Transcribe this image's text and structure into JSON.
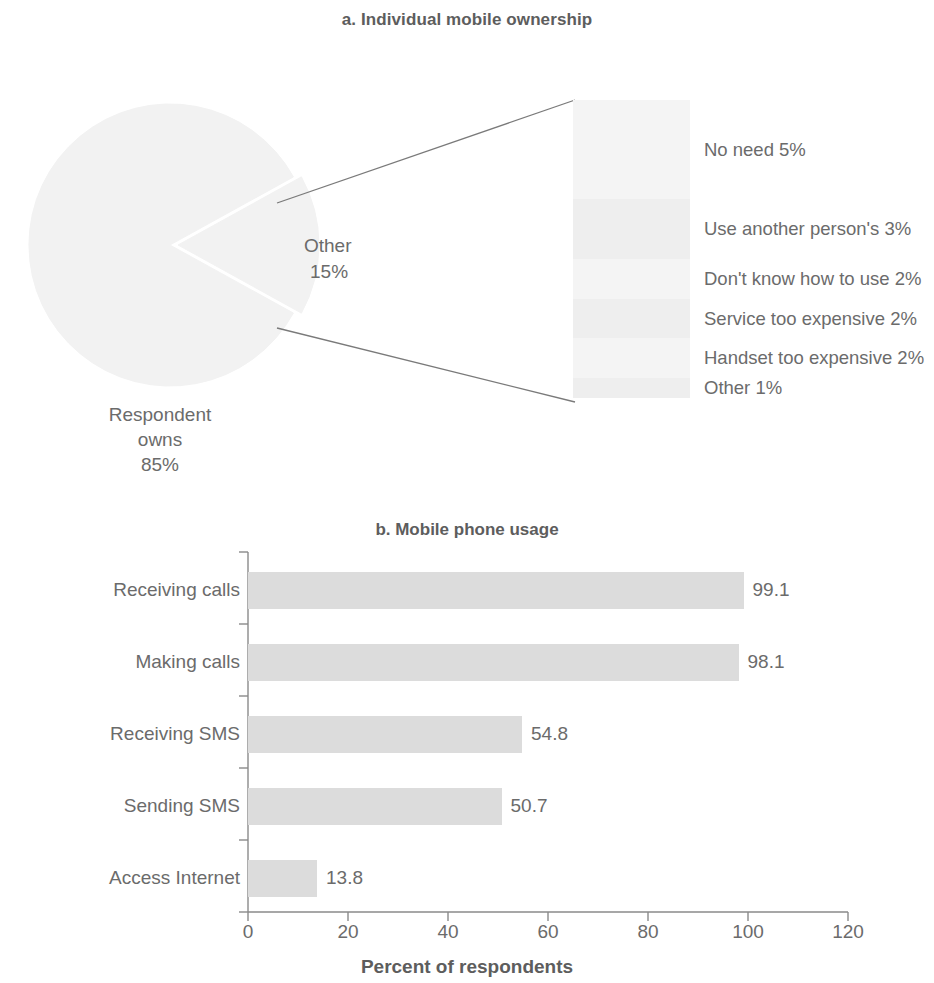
{
  "panel_a": {
    "title": "a. Individual mobile ownership",
    "owns_label": {
      "line1": "Respondent",
      "line2": "owns",
      "line3": "85%"
    },
    "other_label": {
      "line1": "Other",
      "line2": "15%"
    }
  },
  "panel_b": {
    "title": "b. Mobile phone usage"
  },
  "chart_data": [
    {
      "type": "pie",
      "title": "a. Individual mobile ownership",
      "categories": [
        "Respondent owns",
        "Other"
      ],
      "values": [
        85,
        15
      ],
      "value_labels": [
        "85%",
        "15%"
      ],
      "exploded_slice": "Other",
      "breakdown": {
        "type": "bar",
        "note": "Breakdown of the 'Other' 15% slice",
        "categories": [
          "No need",
          "Use another person's",
          "Don't know how to use",
          "Service too expensive",
          "Handset too expensive",
          "Other"
        ],
        "values": [
          5,
          3,
          2,
          2,
          2,
          1
        ],
        "labels": [
          "No need 5%",
          "Use another person's 3%",
          "Don't know how to use 2%",
          "Service too expensive 2%",
          "Handset too expensive 2%",
          "Other 1%"
        ]
      }
    },
    {
      "type": "bar",
      "orientation": "horizontal",
      "title": "b. Mobile phone usage",
      "categories": [
        "Receiving calls",
        "Making calls",
        "Receiving SMS",
        "Sending SMS",
        "Access Internet"
      ],
      "values": [
        99.1,
        98.1,
        54.8,
        50.7,
        13.8
      ],
      "value_labels": [
        "99.1",
        "98.1",
        "54.8",
        "50.7",
        "13.8"
      ],
      "xlabel": "Percent of respondents",
      "ylabel": "",
      "xlim": [
        0,
        120
      ],
      "xticks": [
        0,
        20,
        40,
        60,
        80,
        100,
        120
      ],
      "xtick_labels": [
        "0",
        "20",
        "40",
        "60",
        "80",
        "100",
        "120"
      ],
      "grid": false,
      "legend": "none",
      "bar_color": "#dcdcdc"
    }
  ],
  "colors": {
    "bar_fill": "#dcdcdc",
    "pie_fill": "#f2f2f2",
    "text": "#6b6b6b",
    "axis": "#8a8a8a",
    "leader_line": "#7a7a7a"
  }
}
